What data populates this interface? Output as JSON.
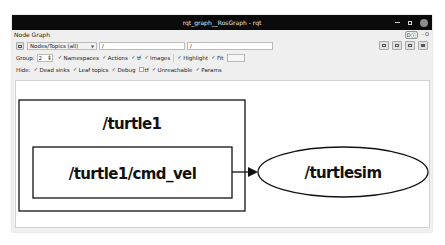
{
  "window": {
    "title": "rqt_graph__RosGraph - rqt",
    "controls": [
      "minimize",
      "maximize",
      "close"
    ]
  },
  "plugin": {
    "title": "Node Graph",
    "header_buttons": [
      "Dⓘ",
      "- O"
    ]
  },
  "toolbar": {
    "refresh_icon": "refresh-icon",
    "mode_select": {
      "value": "Nodes/Topics (all)"
    },
    "node_filter": {
      "value": "/"
    },
    "topic_filter": {
      "value": "/"
    },
    "right_buttons": [
      "load-dot-icon",
      "save-dot-icon",
      "save-svg-icon",
      "save-image-icon"
    ]
  },
  "group_row": {
    "group_label": "Group:",
    "group_value": "2",
    "options": [
      {
        "label": "Namespaces",
        "checked": true
      },
      {
        "label": "Actions",
        "checked": true
      },
      {
        "label": "tf",
        "checked": true
      },
      {
        "label": "Images",
        "checked": true
      },
      {
        "label": "Highlight",
        "checked": true
      },
      {
        "label": "Fit",
        "checked": true
      }
    ]
  },
  "hide_row": {
    "hide_label": "Hide:",
    "options": [
      {
        "label": "Dead sinks",
        "checked": true
      },
      {
        "label": "Leaf topics",
        "checked": true
      },
      {
        "label": "Debug",
        "checked": true
      },
      {
        "label": "tf",
        "checked": false
      },
      {
        "label": "Unreachable",
        "checked": true
      },
      {
        "label": "Params",
        "checked": true
      }
    ]
  },
  "graph": {
    "namespace_box": {
      "label": "/turtle1"
    },
    "topic_node": {
      "label": "/turtle1/cmd_vel"
    },
    "node": {
      "label": "/turtlesim"
    },
    "edge": {
      "from": "/turtle1/cmd_vel",
      "to": "/turtlesim"
    }
  }
}
